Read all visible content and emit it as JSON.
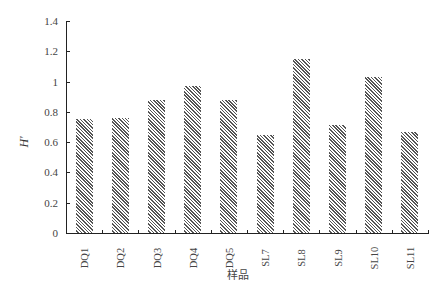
{
  "chart_data": {
    "type": "bar",
    "title": "",
    "xlabel": "样品",
    "ylabel": "H'",
    "ylim": [
      0,
      1.4
    ],
    "yticks": [
      "0",
      "0.2",
      "0.4",
      "0.6",
      "0.8",
      "1",
      "1.2",
      "1.4"
    ],
    "categories": [
      "DQ1",
      "DQ2",
      "DQ3",
      "DQ4",
      "DQ5",
      "SL7",
      "SL8",
      "SL9",
      "SL10",
      "SL11"
    ],
    "values": [
      0.755,
      0.76,
      0.88,
      0.97,
      0.88,
      0.65,
      1.15,
      0.715,
      1.03,
      0.67
    ],
    "grid": false,
    "legend": null,
    "bar_fill": "diagonal hatch"
  },
  "labels": {
    "x_title": "样品",
    "y_title": "H'",
    "yticks": [
      "0",
      "0.2",
      "0.4",
      "0.6",
      "0.8",
      "1",
      "1.2",
      "1.4"
    ],
    "categories": [
      "DQ1",
      "DQ2",
      "DQ3",
      "DQ4",
      "DQ5",
      "SL7",
      "SL8",
      "SL9",
      "SL10",
      "SL11"
    ]
  }
}
